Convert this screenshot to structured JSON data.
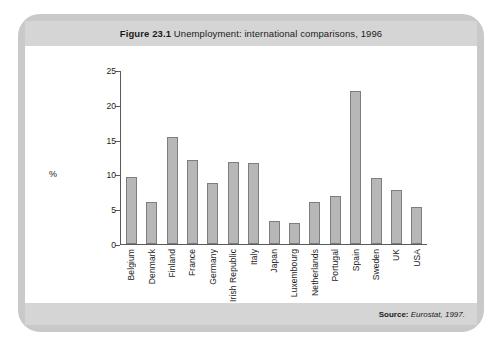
{
  "figure": {
    "label": "Figure 23.1",
    "caption": "Unemployment: international comparisons, 1996",
    "source_label": "Source:",
    "source_text": "Eurostat, 1997."
  },
  "colors": {
    "frame": "#c9c9c9",
    "band": "#d5d5d5",
    "bar_fill": "#b7b7b7",
    "bar_stroke": "#7d7d7d",
    "axis": "#5a5a5a",
    "text": "#1b1b1b"
  },
  "chart_data": {
    "type": "bar",
    "title": "Figure 23.1 Unemployment: international comparisons, 1996",
    "xlabel": "",
    "ylabel": "%",
    "ylim": [
      0,
      25
    ],
    "yticks": [
      0,
      5,
      10,
      15,
      20,
      25
    ],
    "grid": false,
    "legend": null,
    "categories": [
      "Belgium",
      "Denmark",
      "Finland",
      "France",
      "Germany",
      "Irish Republic",
      "Italy",
      "Japan",
      "Luxembourg",
      "Netherlands",
      "Portugal",
      "Spain",
      "Sweden",
      "UK",
      "USA"
    ],
    "values": [
      9.7,
      6.0,
      15.4,
      12.1,
      8.8,
      11.9,
      11.7,
      3.3,
      3.1,
      6.1,
      7.0,
      22.1,
      9.6,
      7.8,
      5.4
    ]
  }
}
